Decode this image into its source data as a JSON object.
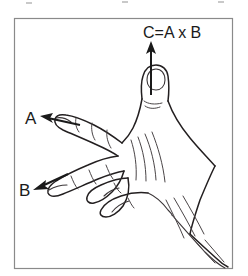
{
  "figure": {
    "title": "right-hand-rule-cross-product",
    "background_color": "#ffffff",
    "ink_color": "#231f20",
    "frame_color": "#8a8a8a",
    "labels": {
      "vector_a": "A",
      "vector_b": "B",
      "result": "C=A x B"
    },
    "arrows": [
      {
        "name": "arrow-c",
        "label": "C=A x B",
        "direction": "up",
        "meaning": "thumb direction, result of cross product"
      },
      {
        "name": "arrow-a",
        "label": "A",
        "direction": "left",
        "meaning": "index finger direction, first vector"
      },
      {
        "name": "arrow-b",
        "label": "B",
        "direction": "down-left",
        "meaning": "middle finger direction, second vector"
      }
    ]
  }
}
